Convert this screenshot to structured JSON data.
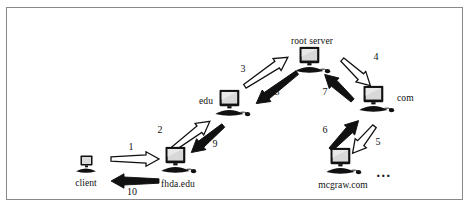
{
  "figure": {
    "border_color": "#8a8a8a",
    "background": "#ffffff",
    "ink_color": "#111111"
  },
  "nodes": [
    {
      "id": "client",
      "label": "client",
      "label_pos": "below",
      "x": 85,
      "y": 166,
      "size": "small",
      "icon": "desktop-computer-icon"
    },
    {
      "id": "fhda",
      "label": "fhda.edu",
      "label_pos": "below",
      "x": 177,
      "y": 162,
      "size": "large",
      "icon": "desktop-computer-icon"
    },
    {
      "id": "edu",
      "label": "edu",
      "label_pos": "left",
      "x": 231,
      "y": 105,
      "size": "large",
      "icon": "desktop-computer-icon"
    },
    {
      "id": "root",
      "label": "root server",
      "label_pos": "above",
      "x": 311,
      "y": 62,
      "size": "large",
      "icon": "desktop-computer-icon"
    },
    {
      "id": "com",
      "label": "com",
      "label_pos": "right",
      "x": 375,
      "y": 101,
      "size": "large",
      "icon": "desktop-computer-icon"
    },
    {
      "id": "mcgraw",
      "label": "mcgraw.com",
      "label_pos": "below",
      "x": 342,
      "y": 163,
      "size": "large",
      "icon": "desktop-computer-icon"
    }
  ],
  "arrows": [
    {
      "id": "a1",
      "number": "1",
      "style": "outline",
      "from": "client",
      "to": "fhda",
      "x1": 110,
      "y1": 158,
      "x2": 158,
      "y2": 158,
      "num_x": 130,
      "num_y": 146
    },
    {
      "id": "a10",
      "number": "10",
      "style": "filled",
      "from": "fhda",
      "to": "client",
      "x1": 158,
      "y1": 176,
      "x2": 110,
      "y2": 176,
      "num_x": 131,
      "num_y": 191
    },
    {
      "id": "a2",
      "number": "2",
      "style": "outline",
      "from": "fhda",
      "to": "edu",
      "x1": 170,
      "y1": 150,
      "x2": 210,
      "y2": 120,
      "num_x": 159,
      "num_y": 129
    },
    {
      "id": "a9",
      "number": "9",
      "style": "filled",
      "from": "edu",
      "to": "fhda",
      "x1": 221,
      "y1": 121,
      "x2": 189,
      "y2": 148,
      "num_x": 214,
      "num_y": 143
    },
    {
      "id": "a3",
      "number": "3",
      "style": "outline",
      "from": "edu",
      "to": "root",
      "x1": 245,
      "y1": 85,
      "x2": 288,
      "y2": 56,
      "num_x": 242,
      "num_y": 68
    },
    {
      "id": "a8",
      "number": "8",
      "style": "filled",
      "from": "root",
      "to": "edu",
      "x1": 295,
      "y1": 68,
      "x2": 254,
      "y2": 99,
      "num_x": 276,
      "num_y": 91
    },
    {
      "id": "a4",
      "number": "4",
      "style": "outline",
      "from": "root",
      "to": "com",
      "x1": 340,
      "y1": 58,
      "x2": 368,
      "y2": 84,
      "num_x": 375,
      "num_y": 56
    },
    {
      "id": "a7",
      "number": "7",
      "style": "filled",
      "from": "com",
      "to": "root",
      "x1": 353,
      "y1": 96,
      "x2": 325,
      "y2": 70,
      "num_x": 324,
      "num_y": 91
    },
    {
      "id": "a5",
      "number": "5",
      "style": "outline",
      "from": "com",
      "to": "mcgraw",
      "x1": 372,
      "y1": 122,
      "x2": 350,
      "y2": 149,
      "num_x": 377,
      "num_y": 141
    },
    {
      "id": "a6",
      "number": "6",
      "style": "filled",
      "from": "mcgraw",
      "to": "com",
      "x1": 331,
      "y1": 148,
      "x2": 359,
      "y2": 119,
      "num_x": 324,
      "num_y": 129
    }
  ],
  "ellipsis": {
    "text": "...",
    "x": 383,
    "y": 172
  }
}
